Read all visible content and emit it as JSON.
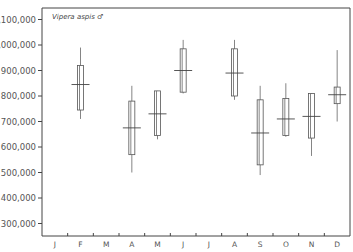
{
  "chart_data": {
    "type": "box",
    "title": "",
    "annotation": "Vipera aspis ♂",
    "xlabel": "",
    "ylabel": "",
    "ylim": [
      250000,
      1100000
    ],
    "yticks": [
      300000,
      400000,
      500000,
      600000,
      700000,
      800000,
      900000,
      1000000,
      1100000
    ],
    "ytick_labels": [
      "300,000",
      "400,000",
      "500,000",
      "600,000",
      "700,000",
      "800,000",
      "900,000",
      "1,000,000",
      "1,100,000"
    ],
    "categories": [
      "J",
      "F",
      "M",
      "A",
      "M",
      "J",
      "J",
      "A",
      "S",
      "O",
      "N",
      "D"
    ],
    "grid": false,
    "legend": null,
    "series": [
      {
        "month": "F",
        "index": 1,
        "whisker_high": 990000,
        "box_high": 920000,
        "median": 845000,
        "box_low": 745000,
        "whisker_low": 710000
      },
      {
        "month": "A",
        "index": 3,
        "whisker_high": 840000,
        "box_high": 780000,
        "median": 675000,
        "box_low": 570000,
        "whisker_low": 500000
      },
      {
        "month": "M",
        "index": 4,
        "whisker_high": 820000,
        "box_high": 820000,
        "median": 730000,
        "box_low": 645000,
        "whisker_low": 630000
      },
      {
        "month": "J",
        "index": 5,
        "whisker_high": 1020000,
        "box_high": 985000,
        "median": 900000,
        "box_low": 815000,
        "whisker_low": 810000
      },
      {
        "month": "A",
        "index": 7,
        "whisker_high": 1020000,
        "box_high": 985000,
        "median": 890000,
        "box_low": 800000,
        "whisker_low": 785000
      },
      {
        "month": "S",
        "index": 8,
        "whisker_high": 840000,
        "box_high": 785000,
        "median": 655000,
        "box_low": 530000,
        "whisker_low": 490000
      },
      {
        "month": "O",
        "index": 9,
        "whisker_high": 850000,
        "box_high": 790000,
        "median": 710000,
        "box_low": 645000,
        "whisker_low": 640000
      },
      {
        "month": "N",
        "index": 10,
        "whisker_high": 810000,
        "box_high": 810000,
        "median": 720000,
        "box_low": 635000,
        "whisker_low": 565000
      },
      {
        "month": "D",
        "index": 11,
        "whisker_high": 980000,
        "box_high": 835000,
        "median": 805000,
        "box_low": 770000,
        "whisker_low": 700000
      }
    ]
  }
}
